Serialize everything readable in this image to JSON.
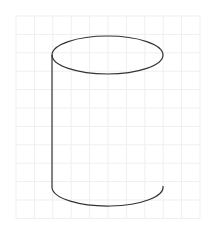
{
  "canvas": {
    "width": 211,
    "height": 238,
    "background": "#ffffff"
  },
  "grid": {
    "x0": 16,
    "y0": 16,
    "x1": 200,
    "y1": 218,
    "spacing": 18.4,
    "color": "#efefef"
  },
  "shape": {
    "type": "cylinder-sketch",
    "stroke": "#333333",
    "stroke_width": 1.2,
    "top_ellipse": {
      "cx": 107.5,
      "cy": 55,
      "rx": 55.5,
      "ry": 19
    },
    "left_edge": {
      "x": 52,
      "y_top": 55,
      "y_bottom": 188
    },
    "bottom_arc": {
      "start": [
        52,
        188
      ],
      "end": [
        163,
        186
      ],
      "rx": 55.5,
      "ry": 19
    }
  }
}
